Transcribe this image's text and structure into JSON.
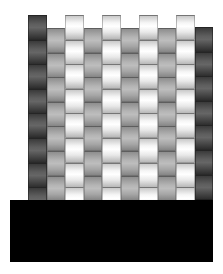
{
  "figure": {
    "colors": {
      "white_strip": "#f6f6f6",
      "gray_strip": "#b4b4b4",
      "dark_strip": "#5e5e5e",
      "base": "#000000",
      "background": "#ffffff"
    },
    "columns": [
      {
        "type": "dark",
        "x": 28,
        "w": 19,
        "top": 15,
        "bottom": 212,
        "row_h": 24.6
      },
      {
        "type": "gray",
        "x": 47,
        "w": 18,
        "top": 28,
        "bottom": 200,
        "row_h": 24.6
      },
      {
        "type": "white",
        "x": 65,
        "w": 19,
        "top": 15,
        "bottom": 212,
        "row_h": 24.6
      },
      {
        "type": "gray",
        "x": 84,
        "w": 18,
        "top": 28,
        "bottom": 200,
        "row_h": 24.6
      },
      {
        "type": "white",
        "x": 102,
        "w": 19,
        "top": 15,
        "bottom": 212,
        "row_h": 24.6
      },
      {
        "type": "gray",
        "x": 121,
        "w": 18,
        "top": 28,
        "bottom": 200,
        "row_h": 24.6
      },
      {
        "type": "white",
        "x": 139,
        "w": 19,
        "top": 15,
        "bottom": 212,
        "row_h": 24.6
      },
      {
        "type": "gray",
        "x": 158,
        "w": 18,
        "top": 28,
        "bottom": 200,
        "row_h": 24.6
      },
      {
        "type": "white",
        "x": 176,
        "w": 19,
        "top": 15,
        "bottom": 212,
        "row_h": 24.6
      },
      {
        "type": "dark",
        "x": 195,
        "w": 18,
        "top": 27,
        "bottom": 200,
        "row_h": 24.6
      }
    ],
    "base": {
      "x": 10,
      "y": 200,
      "w": 203,
      "h": 62
    }
  }
}
